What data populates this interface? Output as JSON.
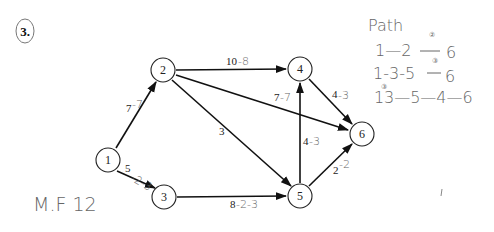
{
  "problem_number": "3.",
  "nodes": [
    {
      "id": "1",
      "x": 108,
      "y": 160
    },
    {
      "id": "2",
      "x": 163,
      "y": 70
    },
    {
      "id": "3",
      "x": 164,
      "y": 197
    },
    {
      "id": "4",
      "x": 300,
      "y": 69
    },
    {
      "id": "5",
      "x": 300,
      "y": 196
    },
    {
      "id": "6",
      "x": 362,
      "y": 134
    }
  ],
  "edges": [
    {
      "from": "1",
      "to": "2",
      "label": "7",
      "hand": "-7"
    },
    {
      "from": "1",
      "to": "3",
      "label": "5",
      "hand": "-2-3"
    },
    {
      "from": "2",
      "to": "4",
      "label": "10",
      "hand": "-8"
    },
    {
      "from": "2",
      "to": "6",
      "label": "7",
      "hand": "-7"
    },
    {
      "from": "2",
      "to": "5",
      "label": "3",
      "hand": ""
    },
    {
      "from": "3",
      "to": "5",
      "label": "8",
      "hand": "-2-3"
    },
    {
      "from": "5",
      "to": "4",
      "label": "4",
      "hand": "-3"
    },
    {
      "from": "4",
      "to": "6",
      "label": "4",
      "hand": "-3"
    },
    {
      "from": "5",
      "to": "6",
      "label": "2",
      "hand": "-2"
    }
  ],
  "annotations": {
    "path_title": "Path",
    "paths": [
      {
        "text_a": "1—2",
        "mark": "②",
        "text_b": "6"
      },
      {
        "text_a": "1-3-5",
        "mark": "③",
        "text_b": "6"
      },
      {
        "text_a": "1",
        "mark": "③",
        "text_b": "3—5—4—6"
      }
    ],
    "max_flow": "M.F 12"
  }
}
